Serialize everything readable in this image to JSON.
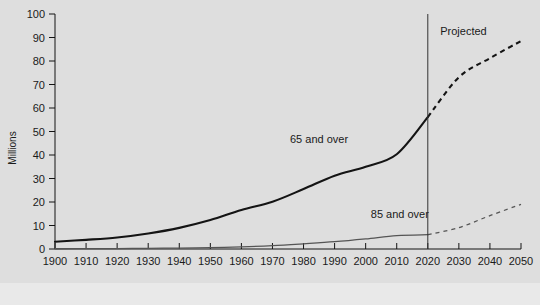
{
  "chart_data": {
    "type": "line",
    "title": "",
    "xlabel": "",
    "ylabel": "Millions",
    "xlim": [
      1900,
      2050
    ],
    "ylim": [
      0,
      100
    ],
    "grid": false,
    "legend_position": "inline-annotations",
    "x_ticks": [
      1900,
      1910,
      1920,
      1930,
      1940,
      1950,
      1960,
      1970,
      1980,
      1990,
      2000,
      2010,
      2020,
      2030,
      2040,
      2050
    ],
    "y_ticks": [
      0,
      10,
      20,
      30,
      40,
      50,
      60,
      70,
      80,
      90,
      100
    ],
    "x": [
      1900,
      1910,
      1920,
      1930,
      1940,
      1950,
      1960,
      1970,
      1980,
      1990,
      2000,
      2010,
      2020,
      2030,
      2040,
      2050
    ],
    "series": [
      {
        "name": "65 and over",
        "label": "65 and over",
        "color": "#141414",
        "values": [
          3.1,
          3.9,
          4.9,
          6.6,
          9.0,
          12.3,
          16.6,
          20.1,
          25.5,
          31.2,
          35.0,
          40.3,
          56.1,
          73.1,
          81.2,
          88.5
        ],
        "solid_through": 2020,
        "projected_from": 2020,
        "label_x": 1985,
        "label_y": 45
      },
      {
        "name": "85 and over",
        "label": "85 and over",
        "color": "#555555",
        "values": [
          0.1,
          0.2,
          0.2,
          0.3,
          0.4,
          0.6,
          0.9,
          1.4,
          2.2,
          3.1,
          4.3,
          5.7,
          6.1,
          9.1,
          14.2,
          19.0
        ],
        "solid_through": 2020,
        "projected_from": 2020,
        "label_x": 2011,
        "label_y": 13
      }
    ],
    "annotations": [
      {
        "name": "projected-divider",
        "type": "vline",
        "x": 2020,
        "label": "Projected",
        "label_x": 2024,
        "label_y": 91
      }
    ]
  },
  "axis": {
    "y_title": "Millions",
    "y_tick_labels": [
      "0",
      "10",
      "20",
      "30",
      "40",
      "50",
      "60",
      "70",
      "80",
      "90",
      "100"
    ],
    "x_tick_labels": [
      "1900",
      "1910",
      "1920",
      "1930",
      "1940",
      "1950",
      "1960",
      "1970",
      "1980",
      "1990",
      "2000",
      "2010",
      "2020",
      "2030",
      "2040",
      "2050"
    ]
  },
  "colors": {
    "background": "#dedede",
    "footer_background": "#e9e9e9",
    "axis": "#141414",
    "series_65": "#141414",
    "series_85": "#555555",
    "divider": "#333333"
  }
}
